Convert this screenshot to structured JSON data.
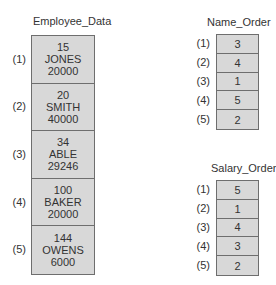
{
  "employee_data": {
    "title": "Employee_Data",
    "records": [
      {
        "label": "(1)",
        "id": "15",
        "name": "JONES",
        "salary": "20000"
      },
      {
        "label": "(2)",
        "id": "20",
        "name": "SMITH",
        "salary": "40000"
      },
      {
        "label": "(3)",
        "id": "34",
        "name": "ABLE",
        "salary": "29246"
      },
      {
        "label": "(4)",
        "id": "100",
        "name": "BAKER",
        "salary": "20000"
      },
      {
        "label": "(5)",
        "id": "144",
        "name": "OWENS",
        "salary": "6000"
      }
    ]
  },
  "name_order": {
    "title": "Name_Order",
    "entries": [
      {
        "label": "(1)",
        "value": "3"
      },
      {
        "label": "(2)",
        "value": "4"
      },
      {
        "label": "(3)",
        "value": "1"
      },
      {
        "label": "(4)",
        "value": "5"
      },
      {
        "label": "(5)",
        "value": "2"
      }
    ]
  },
  "salary_order": {
    "title": "Salary_Order",
    "entries": [
      {
        "label": "(1)",
        "value": "5"
      },
      {
        "label": "(2)",
        "value": "1"
      },
      {
        "label": "(3)",
        "value": "4"
      },
      {
        "label": "(4)",
        "value": "3"
      },
      {
        "label": "(5)",
        "value": "2"
      }
    ]
  },
  "colors": {
    "cell_fill": "#d8d8d8",
    "border": "#6e6e6e",
    "text": "#333333"
  }
}
